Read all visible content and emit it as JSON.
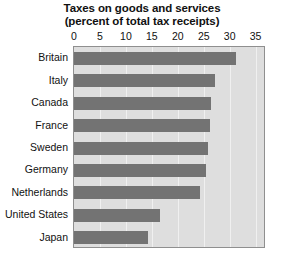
{
  "chart_data": {
    "type": "bar",
    "orientation": "horizontal",
    "title": "Taxes on goods and services",
    "subtitle": "(percent of total tax receipts)",
    "xlabel": "",
    "ylabel": "",
    "xlim": [
      0,
      37
    ],
    "xticks": [
      0,
      5,
      10,
      15,
      20,
      25,
      30,
      35
    ],
    "xtick_labels": [
      "0",
      "5",
      "10",
      "15",
      "20",
      "25",
      "30",
      "35"
    ],
    "grid": true,
    "legend": null,
    "categories": [
      "Britain",
      "Italy",
      "Canada",
      "France",
      "Sweden",
      "Germany",
      "Netherlands",
      "United States",
      "Japan"
    ],
    "values": [
      31.2,
      27.1,
      26.4,
      26.3,
      25.8,
      25.5,
      24.2,
      16.5,
      14.2
    ],
    "bar_color": "#737373",
    "plot_background": "#dedede",
    "plot_border_color": "#8f8f8f",
    "gridline_color": "#f0f0f0",
    "text_color": "#111111"
  }
}
